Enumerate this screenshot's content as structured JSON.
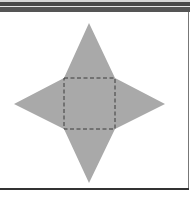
{
  "figure": {
    "type": "square-pyramid-net",
    "colors": {
      "fill": "#a9a9a9",
      "dash": "#3a3a3a",
      "background": "#ffffff",
      "frame": "#4a4a4a"
    },
    "base_square": {
      "x1": 64,
      "y1": 78,
      "x2": 115,
      "y2": 129
    },
    "apex_points": {
      "top": [
        89,
        23
      ],
      "bottom": [
        89,
        183
      ],
      "left": [
        14,
        104
      ],
      "right": [
        165,
        104
      ]
    },
    "labels": []
  }
}
